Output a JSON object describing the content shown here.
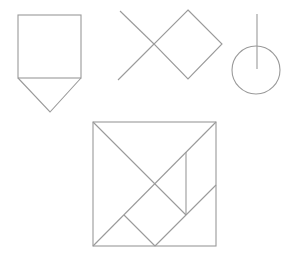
{
  "diagram": {
    "stroke_color": "#9a9a9a",
    "background": "#ffffff",
    "figures": [
      {
        "name": "house-shape",
        "parts": [
          "square",
          "triangle"
        ]
      },
      {
        "name": "fish-shape",
        "parts": [
          "diamond",
          "crossed-lines"
        ]
      },
      {
        "name": "circle-with-line",
        "parts": [
          "circle",
          "vertical-line"
        ]
      }
    ],
    "tangram_square": {
      "pieces": 7
    }
  }
}
